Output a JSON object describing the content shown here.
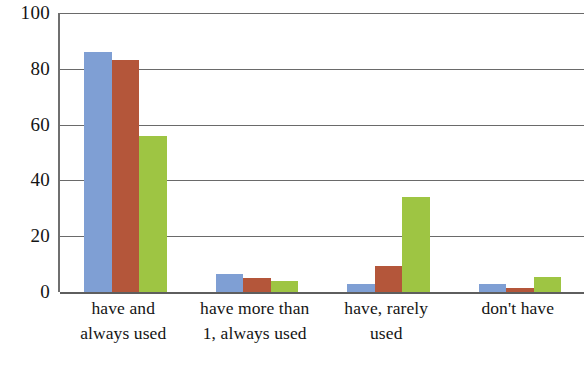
{
  "chart_data": {
    "type": "bar",
    "title": "",
    "subtitle": "",
    "xlabel": "",
    "ylabel": "",
    "categories": [
      "have and always used",
      "have more than 1, always used",
      "have, rarely used",
      "don't have"
    ],
    "category_lines": [
      [
        "have and",
        "always used"
      ],
      [
        "have more than",
        "1, always used"
      ],
      [
        "have, rarely",
        "used"
      ],
      [
        "don't have",
        ""
      ]
    ],
    "series": [
      {
        "name": "Series 1",
        "color": "#7f9fd4",
        "values": [
          86,
          6.5,
          3,
          3
        ]
      },
      {
        "name": "Series 2",
        "color": "#b4563a",
        "values": [
          83,
          5,
          9.5,
          1.5
        ]
      },
      {
        "name": "Series 3",
        "color": "#9ec543",
        "values": [
          56,
          4,
          34,
          5.5
        ]
      }
    ],
    "ylim": [
      0,
      100
    ],
    "yticks": [
      0,
      20,
      40,
      60,
      80,
      100
    ],
    "ytick_labels": [
      "0",
      "20",
      "40",
      "60",
      "80",
      "100"
    ],
    "grid": true,
    "grid_axis": "y",
    "legend": "none",
    "legend_position": "none",
    "bar_group_gap": true,
    "annotations": []
  }
}
